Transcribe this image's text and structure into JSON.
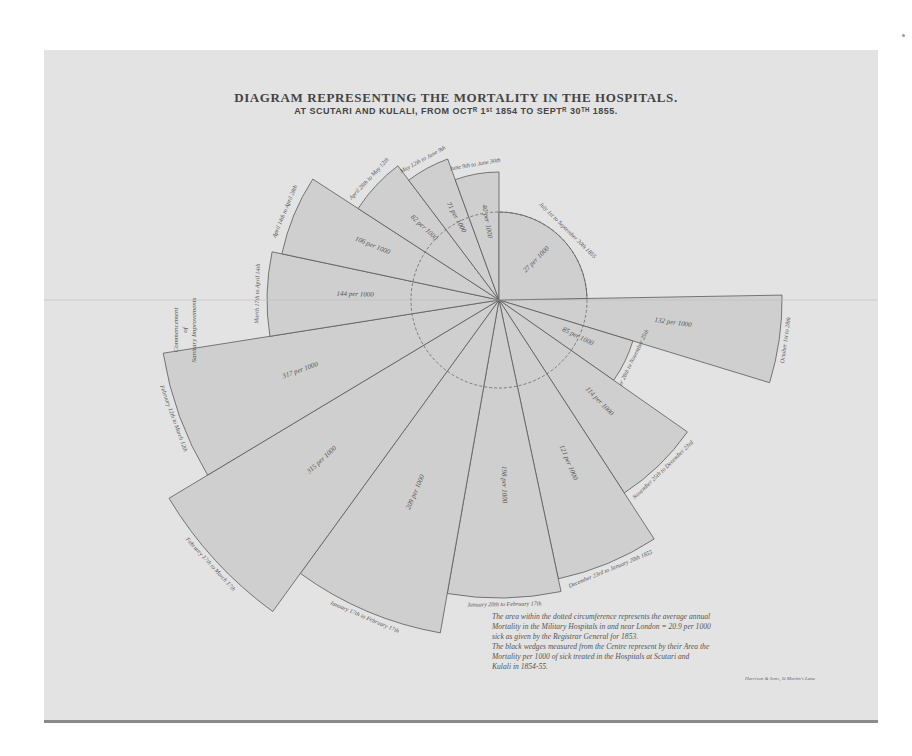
{
  "title": {
    "line1": "DIAGRAM REPRESENTING THE MORTALITY IN THE HOSPITALS.",
    "line2": "AT SCUTARI AND KULALI, FROM OCTᴿ 1ˢᵗ 1854 TO SEPTᴿ 30ᵀᴴ 1855."
  },
  "note": {
    "line1": "The area within the dotted circumference represents the average annual",
    "line2": "Mortality in the Military Hospitals in and near London = 20.9 per 1000",
    "line3": "sick as given by the Registrar General for 1853.",
    "line4": "The black wedges measured from the Centre represent by their Area the",
    "line5": "Mortality per 1000 of sick treated in the Hospitals at Scutari and",
    "line6": "Kulali in 1854-55."
  },
  "credit": "Harrison & Sons, St Martin's Lane",
  "side_label": {
    "line1": "Commencement",
    "line2": "of",
    "line3": "Sanitary Improvements"
  },
  "colors": {
    "sheet": "#e3e3e3",
    "wedge_fill": "#cfcfcf",
    "wedge_stroke": "#5a5a5a",
    "ink": "#444444"
  },
  "chart_data": {
    "type": "polar-area",
    "reference_circle": {
      "label": "Average annual mortality in military hospitals near London",
      "value": 20.9,
      "unit": "per 1000"
    },
    "categories": [
      "October 1st to 28th",
      "October 28th to November 25th",
      "November 25th to December 23rd",
      "December 23rd to January 20th 1855",
      "January 20th to February 17th",
      "January 17th to February 17th",
      "February 17th to March 17th",
      "February 12th to March 12th",
      "March 17th to April 14th",
      "April 14th to May 12th",
      "April 21st to May 19th",
      "May 19th to June 16th",
      "June 16th to June 30th",
      "July 1st to September 30th 1855"
    ],
    "values": [
      132,
      85,
      114,
      121,
      198,
      209,
      315,
      317,
      144,
      106,
      82,
      71,
      40,
      27
    ],
    "unit": "per 1000",
    "wedges": [
      {
        "label": "October 1st to 28th",
        "value_label": "132 per 1000",
        "start_deg": -1,
        "end_deg": 17,
        "r": 283
      },
      {
        "label": "October 28th to November 25th",
        "value_label": "85 per 1000",
        "start_deg": 17,
        "end_deg": 35,
        "r": 140
      },
      {
        "label": "November 25th to December 23rd",
        "value_label": "114 per 1000",
        "start_deg": 35,
        "end_deg": 57,
        "r": 230
      },
      {
        "label": "December 23rd to January 20th 1855",
        "value_label": "121 per 1000",
        "start_deg": 57,
        "end_deg": 78,
        "r": 285
      },
      {
        "label": "January 20th to February 17th",
        "value_label": "198 per 1000",
        "start_deg": 78,
        "end_deg": 100,
        "r": 298
      },
      {
        "label": "January 17th to February 17th",
        "value_label": "209 per 1000",
        "start_deg": 100,
        "end_deg": 126,
        "r": 338
      },
      {
        "label": "February 17th to March 17th",
        "value_label": "315 per 1000",
        "start_deg": 126,
        "end_deg": 149,
        "r": 385
      },
      {
        "label": "February 12th to March 12th",
        "value_label": "317 per 1000",
        "start_deg": 149,
        "end_deg": 171,
        "r": 340
      },
      {
        "label": "March 17th to April 14th",
        "value_label": "144 per 1000",
        "start_deg": 171,
        "end_deg": 192,
        "r": 232
      },
      {
        "label": "April 14th to April 28th",
        "value_label": "106 per 1000",
        "start_deg": 192,
        "end_deg": 213,
        "r": 222
      },
      {
        "label": "April 28th to May 12th",
        "value_label": "82 per 1000",
        "start_deg": 213,
        "end_deg": 233,
        "r": 168
      },
      {
        "label": "May 12th to June 9th",
        "value_label": "71 per 1000",
        "start_deg": 233,
        "end_deg": 250,
        "r": 150
      },
      {
        "label": "June 9th to June 30th",
        "value_label": "40 per 1000",
        "start_deg": 250,
        "end_deg": 270,
        "r": 128
      },
      {
        "label": "July 1st to September 30th 1855",
        "value_label": "27 per 1000",
        "start_deg": 270,
        "end_deg": 359,
        "r": 88
      }
    ],
    "center": [
      499,
      300
    ],
    "reference_radius": 88
  }
}
